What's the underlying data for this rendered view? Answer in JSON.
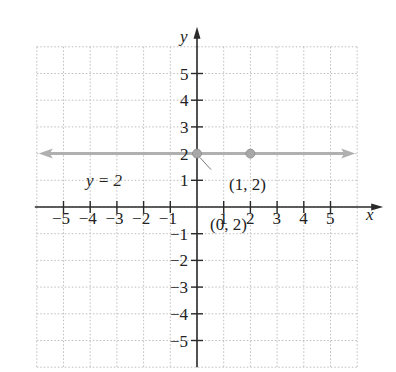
{
  "chart_data": {
    "type": "line",
    "title": "",
    "xlabel": "x",
    "ylabel": "y",
    "xlim": [
      -6,
      6
    ],
    "ylim": [
      -6,
      6
    ],
    "grid": true,
    "x_ticks": [
      -5,
      -4,
      -3,
      -2,
      -1,
      1,
      2,
      3,
      4,
      5
    ],
    "y_ticks": [
      5,
      4,
      3,
      2,
      1,
      -1,
      -2,
      -3,
      -4,
      -5
    ],
    "x_tick_labels": [
      "−5",
      "−4",
      "−3",
      "−2",
      "−1",
      "1",
      "2",
      "3",
      "4",
      "5"
    ],
    "y_tick_labels": [
      "5",
      "4",
      "3",
      "2",
      "1",
      "−1",
      "−2",
      "−3",
      "−4",
      "−5"
    ],
    "series": [
      {
        "name": "y = 2",
        "type": "horizontal_line",
        "y": 2,
        "x_range": [
          -6,
          6
        ],
        "arrows": "both",
        "color": "#b0b0b0"
      }
    ],
    "points": [
      {
        "label": "(0, 2)",
        "x": 0,
        "y": 2
      },
      {
        "label": "(1, 2)",
        "x": 2,
        "y": 2
      }
    ],
    "annotations": [
      "y = 2",
      "(1, 2)",
      "(0, 2)"
    ]
  },
  "labels": {
    "x_axis": "x",
    "y_axis": "y",
    "line_label": "y = 2",
    "point_a": "(1, 2)",
    "point_b": "(0, 2)"
  },
  "colors": {
    "axis": "#2a2a2a",
    "grid": "#bdbdbd",
    "line": "#b0b0b0",
    "point": "#a8a8a8"
  }
}
